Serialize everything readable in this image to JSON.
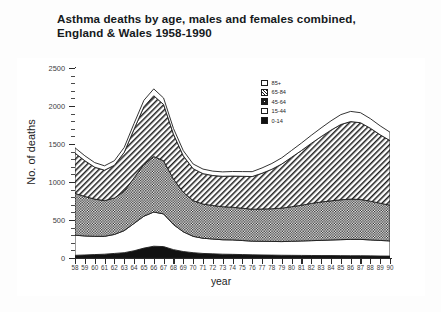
{
  "title": {
    "line1": "Asthma deaths by age, males and females combined,",
    "line2": "England & Wales 1958-1990"
  },
  "chart_data": {
    "type": "area",
    "stacked": true,
    "title": "Asthma deaths by age, males and females combined, England & Wales 1958-1990",
    "xlabel": "year",
    "ylabel": "No. of deaths",
    "ylim": [
      0,
      2500
    ],
    "yticks": [
      0,
      500,
      1000,
      1500,
      2000,
      2500
    ],
    "ytick_labels": [
      "0",
      "500",
      "1000",
      "1500",
      "2000",
      "2500"
    ],
    "grid": false,
    "legend_position": "inside-top-center",
    "x": [
      1958,
      1959,
      1960,
      1961,
      1962,
      1963,
      1964,
      1965,
      1966,
      1967,
      1968,
      1969,
      1970,
      1971,
      1972,
      1973,
      1974,
      1975,
      1976,
      1977,
      1978,
      1979,
      1980,
      1981,
      1982,
      1983,
      1984,
      1985,
      1986,
      1987,
      1988,
      1989,
      1990
    ],
    "xtick_labels": [
      "58",
      "59",
      "60",
      "61",
      "62",
      "63",
      "64",
      "65",
      "66",
      "67",
      "68",
      "69",
      "70",
      "71",
      "72",
      "73",
      "74",
      "75",
      "76",
      "77",
      "78",
      "79",
      "80",
      "81",
      "82",
      "83",
      "84",
      "85",
      "86",
      "87",
      "88",
      "89",
      "90"
    ],
    "series": [
      {
        "name": "0-14",
        "fill": "solid-black",
        "values": [
          35,
          40,
          45,
          50,
          60,
          70,
          95,
          130,
          155,
          150,
          110,
          85,
          70,
          60,
          55,
          50,
          48,
          45,
          42,
          40,
          38,
          36,
          35,
          34,
          33,
          32,
          32,
          31,
          30,
          30,
          28,
          26,
          25
        ]
      },
      {
        "name": "15-44",
        "fill": "white",
        "values": [
          265,
          250,
          240,
          235,
          250,
          290,
          360,
          420,
          450,
          430,
          330,
          260,
          215,
          200,
          195,
          190,
          190,
          185,
          180,
          180,
          180,
          180,
          185,
          190,
          195,
          200,
          205,
          210,
          215,
          215,
          210,
          205,
          200
        ]
      },
      {
        "name": "45-64",
        "fill": "dotted-gray",
        "values": [
          550,
          520,
          490,
          470,
          480,
          520,
          600,
          680,
          730,
          700,
          600,
          520,
          470,
          450,
          440,
          435,
          430,
          425,
          420,
          425,
          430,
          440,
          455,
          470,
          490,
          505,
          515,
          525,
          530,
          525,
          510,
          490,
          470
        ]
      },
      {
        "name": "65-84",
        "fill": "diagonal-hatch",
        "values": [
          530,
          470,
          420,
          400,
          430,
          510,
          640,
          760,
          800,
          740,
          590,
          480,
          420,
          400,
          395,
          400,
          410,
          420,
          430,
          470,
          520,
          580,
          650,
          720,
          790,
          860,
          930,
          990,
          1020,
          1010,
          960,
          900,
          850
        ]
      },
      {
        "name": "85+",
        "fill": "white",
        "values": [
          70,
          65,
          60,
          58,
          60,
          65,
          75,
          85,
          90,
          85,
          75,
          68,
          62,
          60,
          58,
          58,
          60,
          62,
          64,
          70,
          76,
          82,
          90,
          98,
          106,
          114,
          122,
          130,
          134,
          132,
          126,
          118,
          110
        ]
      }
    ],
    "totals": [
      1450,
      1345,
      1255,
      1213,
      1280,
      1455,
      1770,
      2075,
      2225,
      2105,
      1705,
      1413,
      1237,
      1170,
      1143,
      1133,
      1138,
      1137,
      1136,
      1185,
      1244,
      1318,
      1415,
      1512,
      1614,
      1711,
      1804,
      1886,
      1929,
      1912,
      1834,
      1739,
      1655
    ]
  },
  "legend": {
    "items": [
      {
        "label": "85+",
        "fill": "white"
      },
      {
        "label": "65-84",
        "fill": "diagonal-hatch"
      },
      {
        "label": "45-64",
        "fill": "dotted-gray"
      },
      {
        "label": "15-44",
        "fill": "white"
      },
      {
        "label": "0-14",
        "fill": "solid-black"
      }
    ]
  },
  "colors": {
    "ink": "#1d1d1d",
    "axis": "#2a2a2a",
    "background": "#ffffff"
  }
}
